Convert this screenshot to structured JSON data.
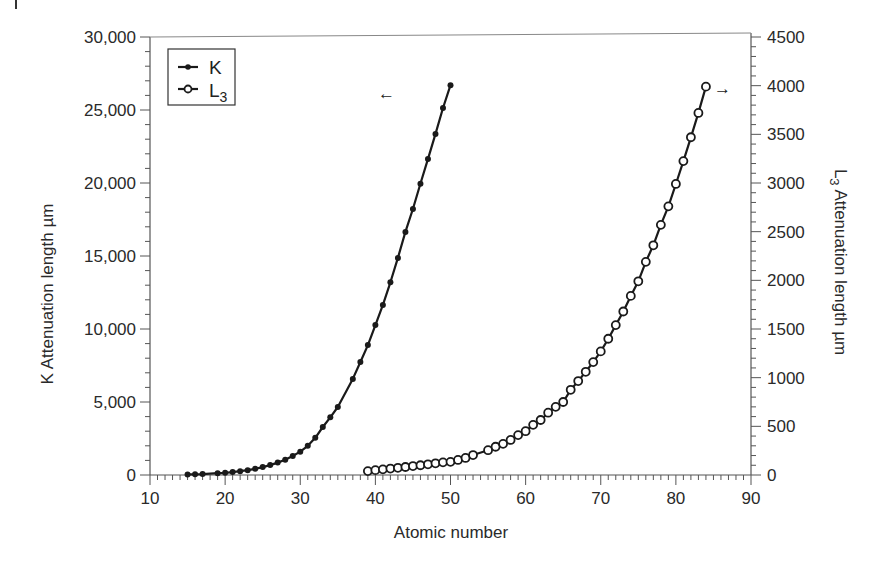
{
  "chart_data": {
    "type": "line",
    "title": "",
    "xlabel": "Atomic number",
    "ylabel": "K Attenuation length µm",
    "ylabel_right": "L₃ Attenuation length µm",
    "xlim": [
      10,
      90
    ],
    "ylim": [
      0,
      30000
    ],
    "ylim_right": [
      0,
      4500
    ],
    "x_ticks": [
      "10",
      "20",
      "30",
      "40",
      "50",
      "60",
      "70",
      "80",
      "90"
    ],
    "y_ticks": [
      "0",
      "5,000",
      "10,000",
      "15,000",
      "20,000",
      "25,000",
      "30,000"
    ],
    "y_ticks_right": [
      "0",
      "500",
      "1000",
      "1500",
      "2000",
      "2500",
      "3000",
      "3500",
      "4000",
      "4500"
    ],
    "grid": false,
    "legend_position": "upper-left",
    "annotations": [
      {
        "text": "←",
        "near_series": "K",
        "meaning": "K uses left axis"
      },
      {
        "text": "→",
        "near_series": "L3",
        "meaning": "L3 uses right axis"
      }
    ],
    "series": [
      {
        "name": "K",
        "axis": "left",
        "marker": "filled-circle",
        "x": [
          15,
          16,
          17,
          19,
          20,
          21,
          22,
          23,
          24,
          25,
          26,
          27,
          28,
          29,
          30,
          31,
          32,
          33,
          34,
          35,
          37,
          38,
          39,
          40,
          41,
          42,
          43,
          44,
          45,
          46,
          47,
          48,
          49,
          50
        ],
        "y": [
          40,
          50,
          60,
          120,
          150,
          200,
          260,
          330,
          420,
          540,
          680,
          850,
          1050,
          1300,
          1600,
          2000,
          2550,
          3290,
          3950,
          4660,
          6580,
          7740,
          8900,
          10270,
          11650,
          13200,
          14870,
          16650,
          18220,
          19950,
          21650,
          23360,
          25140,
          26700
        ]
      },
      {
        "name": "L3",
        "axis": "right",
        "marker": "open-circle",
        "x": [
          39,
          40,
          41,
          42,
          43,
          44,
          45,
          46,
          47,
          48,
          49,
          50,
          51,
          52,
          53,
          55,
          56,
          57,
          58,
          59,
          60,
          61,
          62,
          63,
          64,
          65,
          66,
          67,
          68,
          69,
          70,
          71,
          72,
          73,
          74,
          75,
          76,
          77,
          78,
          79,
          80,
          81,
          82,
          83,
          84
        ],
        "y": [
          40,
          50,
          58,
          66,
          74,
          82,
          92,
          100,
          110,
          120,
          130,
          135,
          155,
          175,
          205,
          255,
          290,
          320,
          360,
          410,
          450,
          515,
          565,
          640,
          700,
          750,
          875,
          965,
          1060,
          1160,
          1270,
          1400,
          1540,
          1680,
          1840,
          1990,
          2190,
          2360,
          2570,
          2760,
          2990,
          3225,
          3470,
          3720,
          3990
        ]
      }
    ]
  },
  "legend": {
    "items": [
      {
        "label": "K",
        "subscript": ""
      },
      {
        "label": "L",
        "subscript": "3"
      }
    ]
  },
  "axes": {
    "x_title": "Atomic number",
    "y_left_title": "K Attenuation length µm",
    "y_right_title_main": "L",
    "y_right_title_sub": "3",
    "y_right_title_rest": " Attenuation length µm"
  },
  "arrows": {
    "left": "←",
    "right": "→"
  },
  "colors": {
    "line": "#1a1a1a",
    "axis": "#555555",
    "text": "#2a2a2a",
    "background": "#ffffff"
  }
}
